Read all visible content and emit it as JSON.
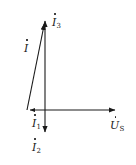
{
  "figure": {
    "type": "phasor-diagram",
    "width": 136,
    "height": 165,
    "background_color": "#ffffff",
    "line_color": "#1a1a1a",
    "origin": {
      "x": 45,
      "y": 110
    },
    "labels": {
      "i3": {
        "symbol": "I",
        "subscript": "3",
        "overdot": true,
        "text": "İ₃"
      },
      "i": {
        "symbol": "I",
        "subscript": "",
        "overdot": true,
        "text": "İ"
      },
      "i1": {
        "symbol": "I",
        "subscript": "1",
        "overdot": true,
        "text": "İ₁"
      },
      "i2": {
        "symbol": "I",
        "subscript": "2",
        "overdot": true,
        "text": "İ₂"
      },
      "us": {
        "symbol": "U",
        "subscript": "S",
        "overdot": true,
        "text": "ŮS"
      }
    },
    "vectors": [
      {
        "name": "i3-vertical-up",
        "from_x": 45,
        "from_y": 110,
        "to_x": 45,
        "to_y": 17,
        "label": "İ₃"
      },
      {
        "name": "i-slanted",
        "from_x": 27,
        "from_y": 110,
        "to_x": 45,
        "to_y": 20,
        "label": "İ"
      },
      {
        "name": "i1-left-short",
        "from_x": 45,
        "from_y": 110,
        "to_x": 27,
        "to_y": 110,
        "label": "İ₁"
      },
      {
        "name": "i2-down",
        "from_x": 45,
        "from_y": 110,
        "to_x": 45,
        "to_y": 137,
        "label": "İ₂"
      },
      {
        "name": "us-right",
        "from_x": 45,
        "from_y": 110,
        "to_x": 120,
        "to_y": 110,
        "label": "ŮS"
      }
    ]
  }
}
